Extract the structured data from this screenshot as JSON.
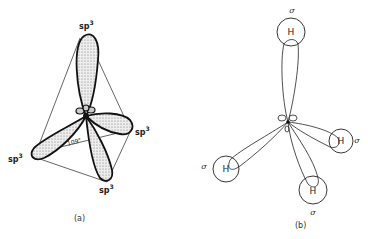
{
  "panel_a": {
    "caption": "(a)",
    "orbital_label": "sp",
    "orbital_sup": "3",
    "angle_label": "109°",
    "lobes": [
      "top",
      "right",
      "left",
      "bottom"
    ]
  },
  "panel_b": {
    "caption": "(b)",
    "atom_label": "H",
    "bond_label": "σ",
    "atoms": [
      "top",
      "right",
      "left",
      "bottom"
    ]
  },
  "colors": {
    "ink": "#1a1a1a",
    "fill_stipple": "#d8d8d8",
    "background": "#ffffff"
  }
}
